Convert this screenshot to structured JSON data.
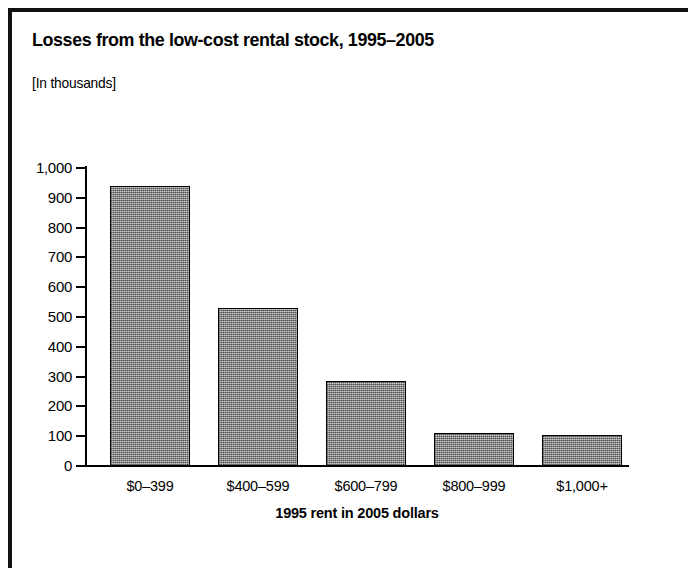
{
  "figure": {
    "title": "Losses from the low-cost rental stock, 1995–2005",
    "subtitle": "[In thousands]"
  },
  "chart_data": {
    "type": "bar",
    "title": "Losses from the low-cost rental stock, 1995–2005",
    "subtitle": "[In thousands]",
    "xlabel": "1995 rent in 2005 dollars",
    "ylabel": "",
    "units": "thousands",
    "categories": [
      "$0–399",
      "$400–599",
      "$600–799",
      "$800–999",
      "$1,000+"
    ],
    "values": [
      940,
      530,
      285,
      110,
      103
    ],
    "ylim": [
      0,
      1000
    ],
    "yticks": [
      0,
      100,
      200,
      300,
      400,
      500,
      600,
      700,
      800,
      900,
      1000
    ],
    "ytick_labels": [
      "0",
      "100",
      "200",
      "300",
      "400",
      "500",
      "600",
      "700",
      "800",
      "900",
      "1,000"
    ],
    "grid": false,
    "legend": null,
    "bar_color": "#9a9a9a",
    "bar_edge_color": "#000000"
  }
}
